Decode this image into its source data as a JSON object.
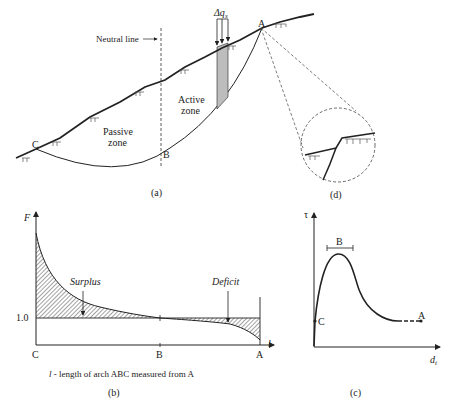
{
  "panel_a": {
    "caption": "(a)",
    "neutral_line_label": "Neutral line",
    "active_zone_line1": "Active",
    "active_zone_line2": "zone",
    "passive_zone_line1": "Passive",
    "passive_zone_line2": "zone",
    "delta_q_label": "Δq",
    "delta_q_sub": "s",
    "point_a": "A",
    "point_b": "B",
    "point_c": "C"
  },
  "panel_d": {
    "caption": "(d)"
  },
  "panel_b": {
    "caption": "(b)",
    "y_axis_label": "F",
    "x_axis_label": "l",
    "y_tick": "1.0",
    "x_ticks": [
      "C",
      "B",
      "A"
    ],
    "surplus_label": "Surplus",
    "deficit_label": "Deficit",
    "note_var": "l",
    "note_text": " - length of arch ABC measured from A"
  },
  "panel_c": {
    "caption": "(c)",
    "y_axis_label": "τ",
    "x_axis_label": "d",
    "x_axis_sub": "t",
    "point_b": "B",
    "point_c": "C",
    "point_a": "A"
  },
  "colors": {
    "ink": "#222222",
    "shade": "#bdbdbd",
    "background": "#ffffff"
  }
}
